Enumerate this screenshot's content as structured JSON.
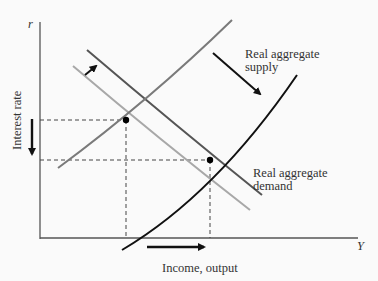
{
  "diagram": {
    "type": "supply-demand shift (interest rate vs income)",
    "axes": {
      "y_symbol": "r",
      "x_symbol": "Y",
      "y_label": "Interest rate",
      "x_label": "Income, output"
    },
    "curves": [
      {
        "id": "supply-initial",
        "label": "",
        "color": "#7a7a7a"
      },
      {
        "id": "supply-shifted",
        "label": "Real aggregate supply",
        "color": "#111111"
      },
      {
        "id": "demand-initial",
        "label": "",
        "color": "#a8a8a8"
      },
      {
        "id": "demand-shifted",
        "label": "Real aggregate demand",
        "color": "#555555"
      }
    ],
    "labels": {
      "supply_line1": "Real aggregate",
      "supply_line2": "supply",
      "demand_line1": "Real aggregate",
      "demand_line2": "demand"
    },
    "equilibria": [
      {
        "id": "initial",
        "note": "higher r, lower Y"
      },
      {
        "id": "final",
        "note": "lower r, higher Y"
      }
    ],
    "arrows": [
      {
        "id": "demand-shift-arrow",
        "direction": "up-right"
      },
      {
        "id": "supply-shift-arrow",
        "direction": "down-right"
      },
      {
        "id": "interest-rate-arrow",
        "direction": "down"
      },
      {
        "id": "income-arrow",
        "direction": "right"
      }
    ],
    "colors": {
      "axis": "#555555",
      "dashed": "#444444",
      "point": "#000000"
    }
  }
}
